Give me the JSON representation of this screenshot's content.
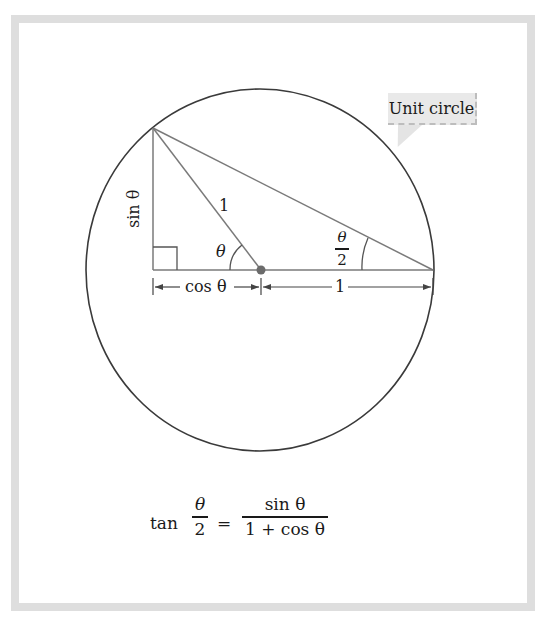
{
  "figure": {
    "callout": {
      "label": "Unit circle"
    },
    "labels": {
      "hypotenuse": "1",
      "theta": "θ",
      "sin": "sin θ",
      "cos": "cos θ",
      "base_right": "1",
      "half_angle_num": "θ",
      "half_angle_den": "2"
    },
    "formula": {
      "lhs_fn": "tan",
      "lhs_num": "θ",
      "lhs_den": "2",
      "equals": "=",
      "rhs_num": "sin θ",
      "rhs_den": "1 + cos θ"
    },
    "colors": {
      "frame": "#dedede",
      "circle": "#3a3a3a",
      "lines": "#7a7a7a",
      "center_dot": "#6b6b6b",
      "callout_bg": "#e9e9e9"
    }
  }
}
